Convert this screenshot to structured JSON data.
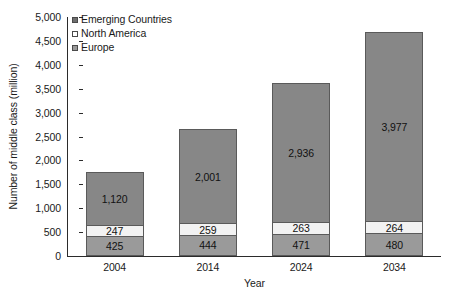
{
  "chart_data": {
    "type": "bar",
    "subtype": "stacked-column",
    "title": "",
    "xlabel": "Year",
    "ylabel": "Number of middle class (million)",
    "categories": [
      "2004",
      "2014",
      "2024",
      "2034"
    ],
    "series": [
      {
        "name": "Europe",
        "values": [
          425,
          444,
          471,
          480
        ],
        "color": "#9a9a9a"
      },
      {
        "name": "North America",
        "values": [
          247,
          259,
          263,
          264
        ],
        "color": "#f2f2f2"
      },
      {
        "name": "Emerging Countries",
        "values": [
          1120,
          2001,
          2936,
          3977
        ],
        "color": "#878787"
      }
    ],
    "data_labels": {
      "Europe": [
        "425",
        "444",
        "471",
        "480"
      ],
      "North America": [
        "247",
        "259",
        "263",
        "264"
      ],
      "Emerging Countries": [
        "1,120",
        "2,001",
        "2,936",
        "3,977"
      ]
    },
    "totals": [
      1792,
      2704,
      3670,
      4721
    ],
    "ylim": [
      0,
      5000
    ],
    "ytick_step": 500,
    "ytick_labels": [
      "5,000",
      "4,500",
      "4,000",
      "3,500",
      "3,000",
      "2,500",
      "2,000",
      "1,500",
      "1,000",
      "500",
      "0"
    ],
    "ytick_values": [
      5000,
      4500,
      4000,
      3500,
      3000,
      2500,
      2000,
      1500,
      1000,
      500,
      0
    ],
    "grid": false,
    "legend_position": "top-left",
    "legend": [
      {
        "label": "Emerging Countries",
        "swatch": "emerging"
      },
      {
        "label": "North America",
        "swatch": "northamerica"
      },
      {
        "label": "Europe",
        "swatch": "europe"
      }
    ]
  }
}
